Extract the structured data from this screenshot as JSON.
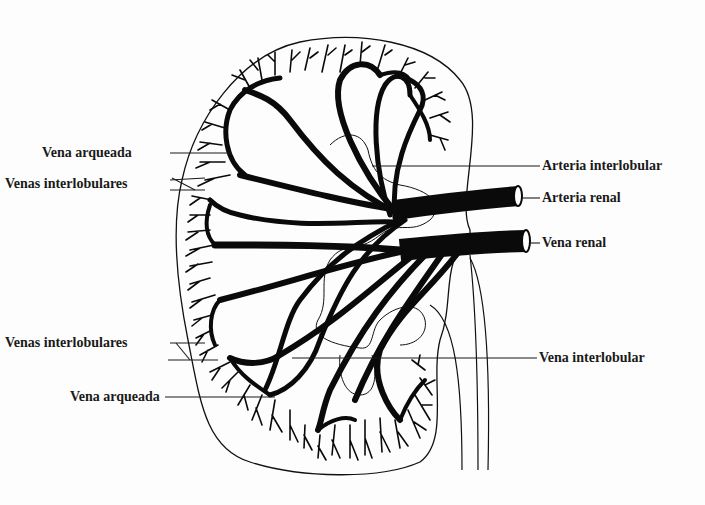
{
  "diagram": {
    "colors": {
      "background": "#fdfdfd",
      "ink": "#111111",
      "label": "#1a1a1a"
    },
    "labels_left": [
      {
        "id": "vena-arqueada-top",
        "text": "Vena arqueada"
      },
      {
        "id": "venas-interlobulares-top",
        "text": "Venas interlobulares"
      },
      {
        "id": "venas-interlobulares-bottom",
        "text": "Venas interlobulares"
      },
      {
        "id": "vena-arqueada-bottom",
        "text": "Vena arqueada"
      }
    ],
    "labels_right": [
      {
        "id": "arteria-interlobular",
        "text": "Arteria interlobular"
      },
      {
        "id": "arteria-renal",
        "text": "Arteria renal"
      },
      {
        "id": "vena-renal",
        "text": "Vena renal"
      },
      {
        "id": "vena-interlobular",
        "text": "Vena interlobular"
      }
    ]
  }
}
